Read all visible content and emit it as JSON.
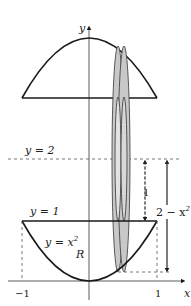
{
  "figure": {
    "axes": {
      "x_label": "x",
      "y_label": "y"
    },
    "ticks": {
      "neg_one": "−1",
      "one": "1"
    },
    "curves": {
      "line_y2": "y = 2",
      "line_y1": "y = 1",
      "parabola": "y = x",
      "parabola_exp": "2",
      "region": "R"
    },
    "dimensions": {
      "inner_radius": "1",
      "outer_radius": "2 − x",
      "outer_radius_exp": "2"
    },
    "colors": {
      "stroke": "#1a1a1a",
      "shade": "#c8c8c8",
      "dash": "#444444"
    }
  }
}
